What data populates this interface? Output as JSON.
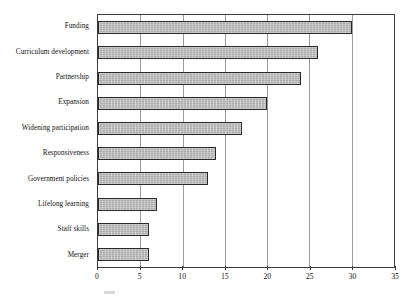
{
  "chart_data": {
    "type": "bar",
    "orientation": "horizontal",
    "title": "",
    "subtitle": "",
    "xlabel": "",
    "ylabel": "",
    "categories": [
      "Funding",
      "Curriculum development",
      "Partnership",
      "Expansion",
      "Widening participation",
      "Responsiveness",
      "Government policies",
      "Lifelong learning",
      "Staff skills",
      "Merger"
    ],
    "values": [
      30,
      26,
      24,
      20,
      17,
      14,
      13,
      7,
      6,
      6
    ],
    "xlim": [
      0,
      35
    ],
    "xticks": [
      0,
      5,
      10,
      15,
      20,
      25,
      30,
      35
    ],
    "xtick_labels": [
      "0",
      "5",
      "10",
      "15",
      "20",
      "25",
      "30",
      "35"
    ],
    "grid": "vertical",
    "legend": "none",
    "bar_fill_color": "#b4b4b4",
    "bar_border_color": "#2b2b2b",
    "axis_color": "#3b3b3b",
    "gridline_color": "#9a9a9a",
    "background_color": "#ffffff"
  }
}
